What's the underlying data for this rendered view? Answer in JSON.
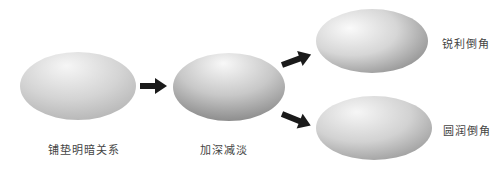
{
  "diagram": {
    "type": "flow",
    "nodes": [
      {
        "id": "n1",
        "label": "铺垫明暗关系",
        "shape": "ellipse",
        "shading": "soft-gradient"
      },
      {
        "id": "n2",
        "label": "加深减淡",
        "shape": "ellipse",
        "shading": "strong-gradient"
      },
      {
        "id": "n3",
        "label": "锐利倒角",
        "shape": "ellipse",
        "shading": "sharp-bevel"
      },
      {
        "id": "n4",
        "label": "圆润倒角",
        "shape": "ellipse",
        "shading": "round-bevel"
      }
    ],
    "edges": [
      {
        "from": "n1",
        "to": "n2",
        "icon": "arrow-right-icon"
      },
      {
        "from": "n2",
        "to": "n3",
        "icon": "arrow-up-right-icon"
      },
      {
        "from": "n2",
        "to": "n4",
        "icon": "arrow-down-right-icon"
      }
    ],
    "colors": {
      "background": "#ffffff",
      "arrow": "#1a1a1a",
      "label": "#444444",
      "ellipse_light": "#f4f4f4",
      "ellipse_dark": "#8a8a8a"
    }
  }
}
